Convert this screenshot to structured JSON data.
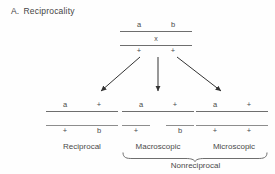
{
  "figure": {
    "panel_letter": "A.",
    "panel_title": "Reciprocality",
    "background_color": "#fefefe",
    "line_color": "#6e6e6e",
    "text_color": "#4a4a4a"
  },
  "parent_cross": {
    "top_strand": {
      "left_allele": "a",
      "right_allele": "b"
    },
    "cross_symbol": "x",
    "bottom_strand": {
      "left_allele": "+",
      "right_allele": "+"
    }
  },
  "arrows": [
    {
      "name": "arrow-to-reciprocal",
      "direction": "down-left"
    },
    {
      "name": "arrow-to-macroscopic",
      "direction": "down"
    },
    {
      "name": "arrow-to-microscopic",
      "direction": "down-right"
    }
  ],
  "progeny": [
    {
      "id": "reciprocal",
      "caption": "Reciprocal",
      "top_strand": {
        "left_allele": "a",
        "right_allele": "+"
      },
      "bottom_strand": {
        "left_allele": "+",
        "right_allele": "b"
      },
      "bottom_strand_broken": false
    },
    {
      "id": "macroscopic",
      "caption": "Macroscopic",
      "top_strand": {
        "left_allele": "a",
        "right_allele": "+"
      },
      "bottom_strand": {
        "left_allele": "+",
        "right_allele": "b"
      },
      "bottom_strand_broken": true
    },
    {
      "id": "microscopic",
      "caption": "Microscopic",
      "top_strand": {
        "left_allele": "a",
        "right_allele": "+"
      },
      "bottom_strand": {
        "left_allele": "+",
        "right_allele": "+"
      },
      "bottom_strand_broken": false
    }
  ],
  "grouping": {
    "brace_label": "Nonreciprocal",
    "brace_spans": [
      "macroscopic",
      "microscopic"
    ]
  }
}
